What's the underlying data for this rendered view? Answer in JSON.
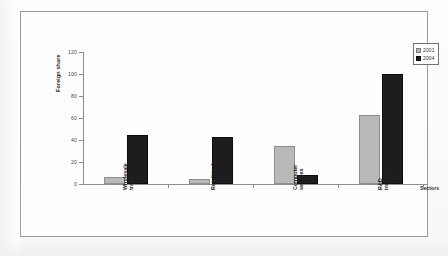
{
  "figure": {
    "background_color": "#fdfdfd",
    "frame_color": "#9a9a9a"
  },
  "legend": {
    "position": "top-right",
    "entries": [
      {
        "label": "2001",
        "color": "#b9b9b9"
      },
      {
        "label": "2004",
        "color": "#1d1d1d"
      }
    ]
  },
  "axes": {
    "y_title": "Foreign share",
    "x_title": "Sectors",
    "y_ticks": [
      "0",
      "20",
      "40",
      "60",
      "80",
      "100",
      "120"
    ]
  },
  "chart_data": {
    "type": "bar",
    "title": "",
    "subtitle": "",
    "xlabel": "Sectors",
    "ylabel": "Foreign share",
    "ylim": [
      0,
      120
    ],
    "ytick_step": 20,
    "grid": false,
    "legend_position": "top-right",
    "categories": [
      "Wholesale\ntrade",
      "Retail trade",
      "Computer\nservices",
      "R&D\ninstitutions"
    ],
    "category_labels_flat": [
      "Wholesale trade",
      "Retail trade",
      "Computer services",
      "R&D institutions"
    ],
    "series": [
      {
        "name": "2001",
        "color": "#b9b9b9",
        "values": [
          6,
          5,
          35,
          63
        ]
      },
      {
        "name": "2004",
        "color": "#1d1d1d",
        "values": [
          45,
          43,
          8,
          100
        ]
      }
    ]
  }
}
